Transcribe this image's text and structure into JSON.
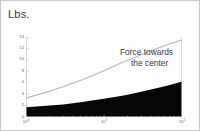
{
  "figure": {
    "unit_title": "Lbs."
  },
  "annotation": {
    "line1": "Force  towards",
    "line2": "the center"
  },
  "chart_data": {
    "type": "area",
    "title": "Lbs.",
    "xlabel": "",
    "ylabel": "Lbs.",
    "xscale": "log",
    "yscale": "linear",
    "xlim": [
      1,
      100
    ],
    "ylim": [
      0,
      14
    ],
    "grid": false,
    "legend": "none",
    "x_tick_labels": [
      "10⁰",
      "10¹",
      "10²"
    ],
    "x_tick_values": [
      1,
      10,
      100
    ],
    "y_tick_labels": [
      "0",
      "2",
      "4",
      "6",
      "8",
      "10",
      "12",
      "14"
    ],
    "y_tick_values": [
      0,
      2,
      4,
      6,
      8,
      10,
      12,
      14
    ],
    "x": [
      1,
      2,
      3,
      5,
      7,
      10,
      15,
      20,
      30,
      50,
      70,
      100
    ],
    "series": [
      {
        "name": "Force towards the center",
        "style": "thin-line",
        "color": "#8a8a8a",
        "values": [
          3.3,
          4.5,
          5.3,
          6.4,
          7.2,
          8.1,
          9.2,
          9.9,
          10.9,
          12.1,
          12.8,
          13.5
        ]
      },
      {
        "name": "filled-area",
        "style": "filled-black",
        "color": "#070707",
        "values": [
          1.7,
          2.0,
          2.2,
          2.6,
          2.9,
          3.2,
          3.6,
          3.9,
          4.4,
          5.1,
          5.6,
          6.2
        ]
      }
    ],
    "annotations": [
      {
        "text": "Force towards the center",
        "target_series": "Force towards the center",
        "x": 20,
        "y": 10.4
      }
    ]
  }
}
